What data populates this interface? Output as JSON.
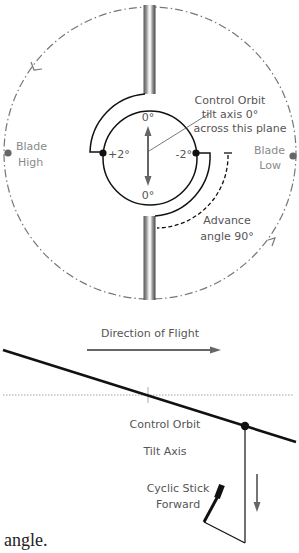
{
  "top_diagram": {
    "control_orbit_label_line1": "Control Orbit",
    "control_orbit_label_line2": "tilt axis 0°",
    "control_orbit_label_line3": "across this plane",
    "top_angle": "0°",
    "bottom_angle": "0°",
    "left_angle": "+2°",
    "right_angle": "-2°",
    "blade_high_line1": "Blade",
    "blade_high_line2": "High",
    "blade_low_line1": "Blade",
    "blade_low_line2": "Low",
    "advance_line1": "Advance",
    "advance_line2": "angle 90°"
  },
  "bottom_diagram": {
    "direction_label": "Direction of Flight",
    "tilt_axis_line1": "Control Orbit",
    "tilt_axis_line2": "Tilt Axis",
    "cyclic_line1": "Cyclic Stick",
    "cyclic_line2": "Forward"
  },
  "caption": "angle.",
  "colors": {
    "line": "#111111",
    "label": "#555555",
    "label_light": "#8a8a8a",
    "arrow_grey": "#666666",
    "dashdot": "#777777"
  }
}
